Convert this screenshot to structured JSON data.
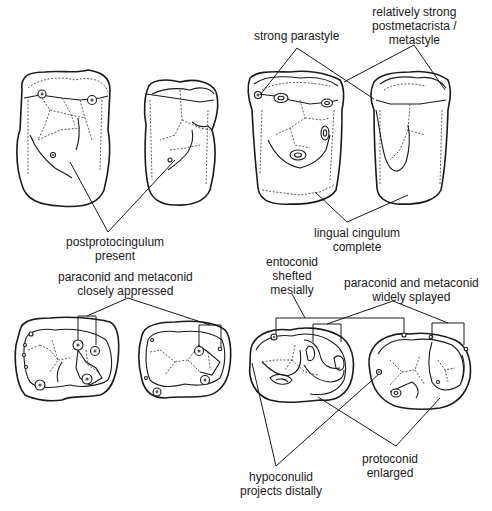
{
  "figure": {
    "panels": [
      {
        "id": "upper-left",
        "description": "Upper molars, occlusal views (two teeth)"
      },
      {
        "id": "upper-right",
        "description": "Upper molars, occlusal views (two teeth)"
      },
      {
        "id": "lower-left",
        "description": "Lower molars, occlusal views (two teeth)"
      },
      {
        "id": "lower-right",
        "description": "Lower molars, occlusal views (two teeth)"
      }
    ]
  },
  "labels": {
    "strong_parastyle": [
      "strong parastyle"
    ],
    "postmetacrista": [
      "relatively strong",
      "postmetacrista /",
      "metastyle"
    ],
    "postprotocingulum": [
      "postprotocingulum",
      "present"
    ],
    "lingual_cingulum": [
      "lingual cingulum",
      "complete"
    ],
    "closely_appressed": [
      "paraconid and metaconid",
      "closely appressed"
    ],
    "entoconid": [
      "entoconid",
      "shefted",
      "mesially"
    ],
    "widely_splayed": [
      "paraconid and metaconid",
      "widely splayed"
    ],
    "hypoconulid": [
      "hypoconulid",
      "projects distally"
    ],
    "protoconid": [
      "protoconid",
      "enlarged"
    ]
  }
}
